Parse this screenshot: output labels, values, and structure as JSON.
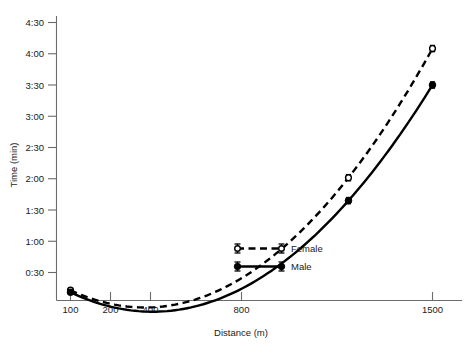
{
  "chart_data": {
    "type": "line",
    "title": "",
    "xlabel": "Distance (m)",
    "ylabel": "Time (min)",
    "xscale": "log",
    "x": [
      100,
      200,
      400,
      800,
      1500
    ],
    "xtick_labels": [
      "100",
      "200",
      "400",
      "800",
      "1500"
    ],
    "ytick_labels": [
      "0:30",
      "1:00",
      "1:30",
      "2:00",
      "2:30",
      "3:00",
      "3:30",
      "4:00",
      "4:30"
    ],
    "ytick_values_sec": [
      30,
      60,
      90,
      120,
      150,
      180,
      210,
      240,
      270
    ],
    "ylim_sec": [
      0,
      270
    ],
    "grid": false,
    "legend_position": "center-right-inside",
    "series": [
      {
        "name": "Female",
        "marker": "open-circle",
        "linestyle": "dashed",
        "color": "#000000",
        "x": [
          100,
          800,
          1500
        ],
        "values_label": [
          "0:13",
          "2:01",
          "4:05"
        ],
        "values_sec": [
          13,
          121,
          245
        ],
        "error_bars_sec": [
          2,
          3,
          3
        ]
      },
      {
        "name": "Male",
        "marker": "filled-circle",
        "linestyle": "solid",
        "color": "#000000",
        "x": [
          100,
          800,
          1500
        ],
        "values_label": [
          "0:11",
          "1:39",
          "3:30"
        ],
        "values_sec": [
          11,
          99,
          210
        ],
        "error_bars_sec": [
          2,
          3,
          3
        ]
      }
    ],
    "legend": [
      {
        "label": "Female",
        "marker": "open-circle",
        "linestyle": "dashed"
      },
      {
        "label": "Male",
        "marker": "filled-circle",
        "linestyle": "solid"
      }
    ]
  },
  "axes": {
    "y_title": "Time (min)",
    "x_title": "Distance (m)"
  }
}
